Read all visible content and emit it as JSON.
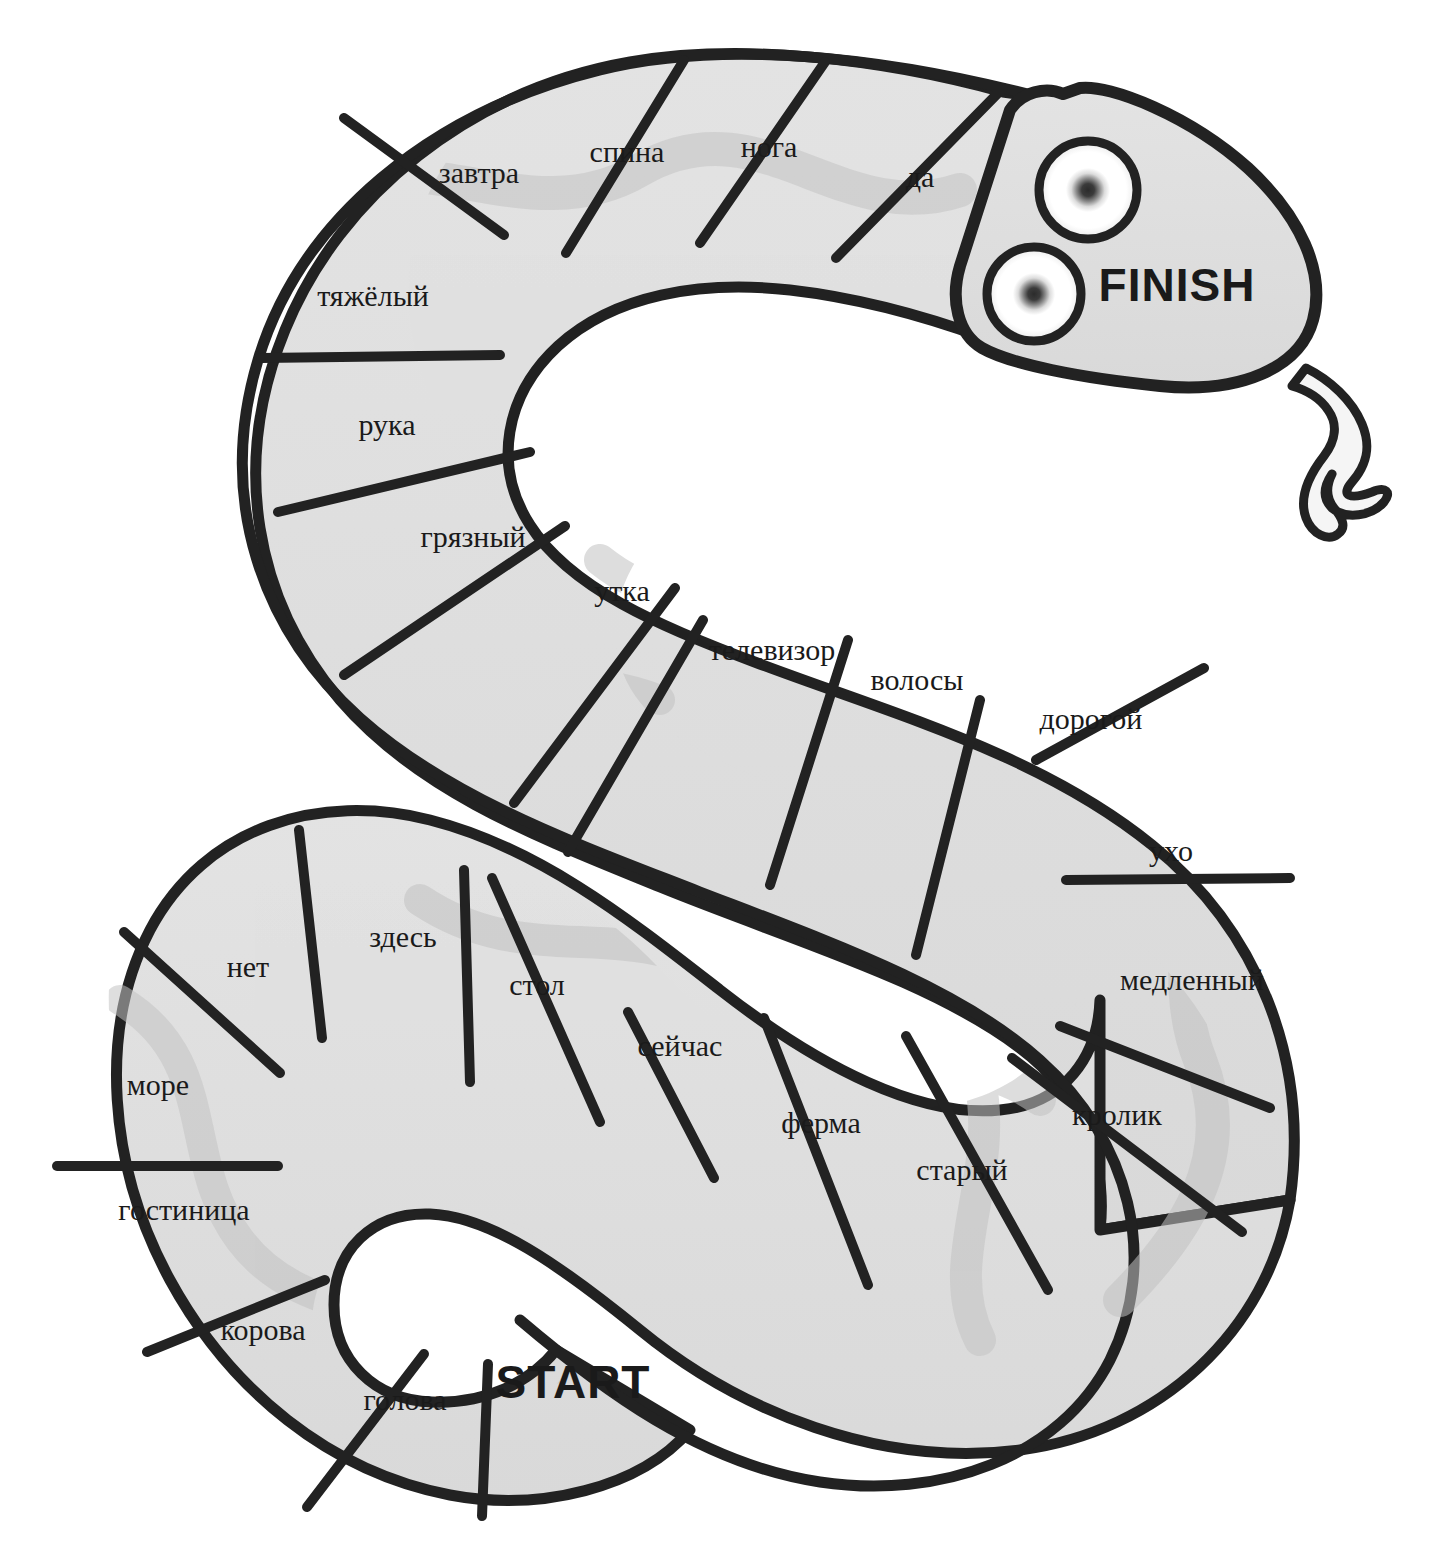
{
  "board": {
    "title": "Russian vocabulary snake board game",
    "colors": {
      "body_fill": "#dcdcdc",
      "body_fill_light": "#e4e4e4",
      "wave_pattern": "#c4c4c4",
      "outline": "#222222",
      "text": "#1a1a1a",
      "background": "#ffffff",
      "hole_fill": "#ffffff",
      "tongue_fill": "#f2f2f2",
      "eye_outer": "#222222",
      "eye_white": "#ffffff",
      "eye_pupil": "#333333"
    },
    "start_label": "START",
    "finish_label": "FINISH",
    "cell_count": 24,
    "cells": [
      {
        "index": 1,
        "label": "голова",
        "x": 405,
        "y": 1403,
        "rotate": 0
      },
      {
        "index": 2,
        "label": "корова",
        "x": 263,
        "y": 1333,
        "rotate": 0
      },
      {
        "index": 3,
        "label": "гостиница",
        "x": 184,
        "y": 1213,
        "rotate": 0
      },
      {
        "index": 4,
        "label": "море",
        "x": 158,
        "y": 1088,
        "rotate": 0
      },
      {
        "index": 5,
        "label": "нет",
        "x": 248,
        "y": 970,
        "rotate": 0
      },
      {
        "index": 6,
        "label": "здесь",
        "x": 403,
        "y": 940,
        "rotate": 0
      },
      {
        "index": 7,
        "label": "стол",
        "x": 537,
        "y": 988,
        "rotate": 0
      },
      {
        "index": 8,
        "label": "сейчас",
        "x": 680,
        "y": 1049,
        "rotate": 0
      },
      {
        "index": 9,
        "label": "ферма",
        "x": 821,
        "y": 1126,
        "rotate": 0
      },
      {
        "index": 10,
        "label": "старый",
        "x": 962,
        "y": 1173,
        "rotate": 0
      },
      {
        "index": 11,
        "label": "кролик",
        "x": 1117,
        "y": 1118,
        "rotate": 0
      },
      {
        "index": 12,
        "label": "медленный",
        "x": 1192,
        "y": 983,
        "rotate": 0
      },
      {
        "index": 13,
        "label": "ухо",
        "x": 1171,
        "y": 854,
        "rotate": 0
      },
      {
        "index": 14,
        "label": "дорогой",
        "x": 1091,
        "y": 722,
        "rotate": 0
      },
      {
        "index": 15,
        "label": "волосы",
        "x": 917,
        "y": 683,
        "rotate": 0
      },
      {
        "index": 16,
        "label": "телевизор",
        "x": 772,
        "y": 653,
        "rotate": 0
      },
      {
        "index": 17,
        "label": "утка",
        "x": 622,
        "y": 594,
        "rotate": 0
      },
      {
        "index": 18,
        "label": "грязный",
        "x": 473,
        "y": 540,
        "rotate": 0
      },
      {
        "index": 19,
        "label": "рука",
        "x": 387,
        "y": 428,
        "rotate": 0
      },
      {
        "index": 20,
        "label": "тяжёлый",
        "x": 373,
        "y": 299,
        "rotate": 0
      },
      {
        "index": 21,
        "label": "завтра",
        "x": 479,
        "y": 176,
        "rotate": 0
      },
      {
        "index": 22,
        "label": "спина",
        "x": 627,
        "y": 155,
        "rotate": 0
      },
      {
        "index": 23,
        "label": "нога",
        "x": 769,
        "y": 150,
        "rotate": 0
      },
      {
        "index": 24,
        "label": "да",
        "x": 920,
        "y": 180,
        "rotate": 0
      }
    ],
    "start_marker": {
      "label": "START",
      "x": 573,
      "y": 1386
    },
    "finish_marker": {
      "label": "FINISH",
      "x": 1177,
      "y": 289
    },
    "eyes": [
      {
        "name": "upper-eye",
        "cx": 1088,
        "cy": 190,
        "r": 49
      },
      {
        "name": "lower-eye",
        "cx": 1034,
        "cy": 294,
        "r": 47
      }
    ]
  }
}
